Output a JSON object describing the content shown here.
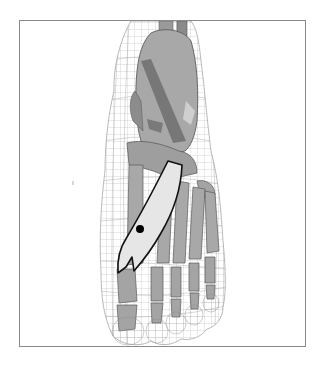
{
  "figure": {
    "view": "dorsal",
    "caption": "",
    "colors": {
      "background": "#ffffff",
      "frame_border": "#8a8a8a",
      "wireframe": "#9a9a9a",
      "bone_fill": "#a8a8a8",
      "bone_dark": "#6e6e6e",
      "bone_light": "#c8c8c8",
      "highlight_fill": "#e4e4e4",
      "highlight_outline": "#111111",
      "marker": "#000000"
    },
    "highlighted_structure": {
      "name": "first-metatarsal-region",
      "marker": {
        "x": 139,
        "y": 228,
        "r": 4
      }
    }
  }
}
